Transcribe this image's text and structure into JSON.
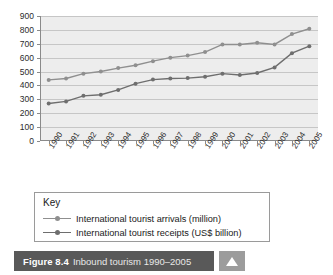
{
  "figure": {
    "number": "Figure 8.4",
    "caption": "Inbound tourism 1990–2005",
    "nav_icon": "triangle-up-icon"
  },
  "key": {
    "title": "Key",
    "entries": [
      {
        "label": "International tourist arrivals (million)",
        "color": "#8f8f8f",
        "marker": "circle"
      },
      {
        "label": "International tourist receipts (US$ billion)",
        "color": "#6e6e6e",
        "marker": "circle"
      }
    ]
  },
  "chart_data": {
    "type": "line",
    "title": "Inbound tourism 1990–2005",
    "xlabel": "",
    "ylabel": "",
    "ylim": [
      0,
      900
    ],
    "ytick_step": 100,
    "yticks": [
      0,
      100,
      200,
      300,
      400,
      500,
      600,
      700,
      800,
      900
    ],
    "grid": true,
    "legend_position": "below-plot",
    "categories": [
      "1990",
      "1991",
      "1992",
      "1993",
      "1994",
      "1995",
      "1996",
      "1997",
      "1998",
      "1999",
      "2000",
      "2001",
      "2002",
      "2003",
      "2004",
      "2005"
    ],
    "series": [
      {
        "name": "International tourist arrivals (million)",
        "color": "#8f8f8f",
        "values": [
          440,
          450,
          485,
          500,
          525,
          545,
          575,
          600,
          615,
          640,
          695,
          695,
          707,
          695,
          770,
          808
        ]
      },
      {
        "name": "International tourist receipts (US$ billion)",
        "color": "#6e6e6e",
        "values": [
          270,
          285,
          325,
          333,
          368,
          413,
          442,
          450,
          453,
          463,
          485,
          475,
          490,
          530,
          632,
          683
        ]
      }
    ]
  }
}
